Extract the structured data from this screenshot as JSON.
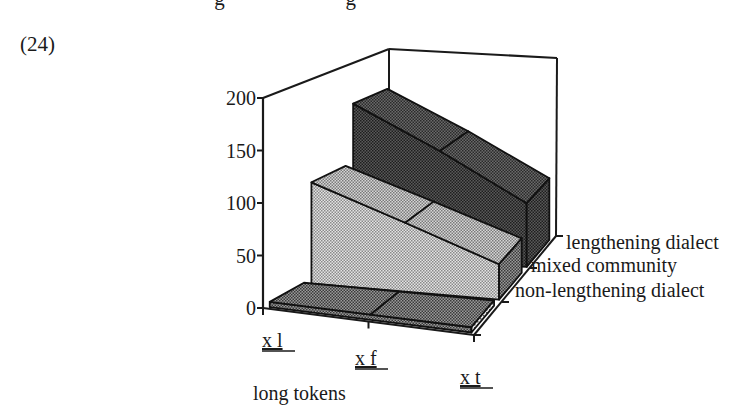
{
  "page": {
    "clipped_heading_text": "…lengthening…",
    "example_number": "(24)"
  },
  "chart_data": {
    "type": "3d-ribbon",
    "title": "",
    "xlabel": "long tokens",
    "ylabel": "",
    "categories": [
      "x_l",
      "x_f",
      "x_t"
    ],
    "category_labels": [
      "x  l",
      "x  f",
      "x  t"
    ],
    "ylim": [
      0,
      200
    ],
    "yticks": [
      0,
      50,
      100,
      150,
      200
    ],
    "grid": false,
    "legend_position": "right (depth axis labels)",
    "series": [
      {
        "name": "non-lengthening dialect",
        "values": [
          5,
          5,
          5
        ],
        "color": "#6e6e6e"
      },
      {
        "name": "mixed community",
        "values": [
          100,
          68,
          35
        ],
        "color": "#bdbdbd"
      },
      {
        "name": "lengthening dialect",
        "values": [
          160,
          115,
          65
        ],
        "color": "#3a3a3a"
      }
    ]
  },
  "colors": {
    "axis": "#1a1a1a",
    "background": "#ffffff",
    "dark_series": "#3a3a3a",
    "light_series": "#bdbdbd",
    "mid_series": "#6e6e6e"
  }
}
